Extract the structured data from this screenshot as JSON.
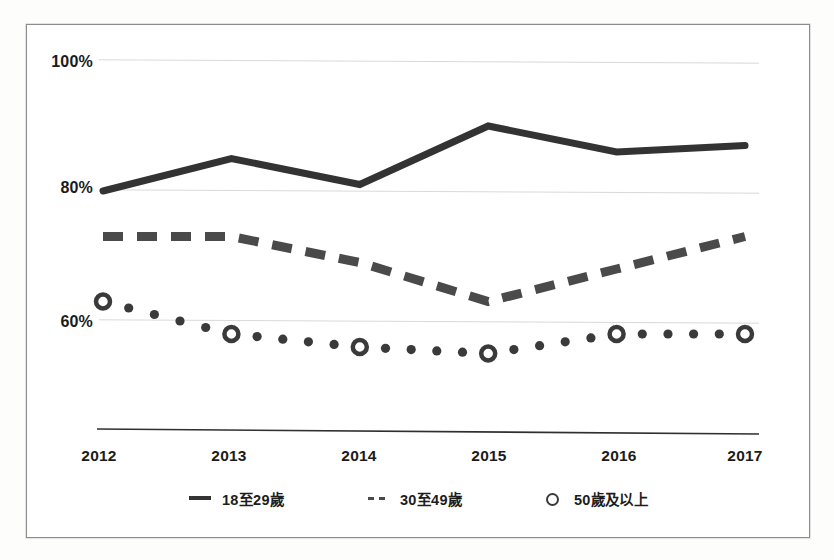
{
  "chart_data": {
    "type": "line",
    "title": "",
    "subtitle": "",
    "xlabel": "",
    "ylabel": "",
    "categories": [
      "2012",
      "2013",
      "2014",
      "2015",
      "2016",
      "2017"
    ],
    "x": [
      2012,
      2013,
      2014,
      2015,
      2016,
      2017
    ],
    "xlim": [
      2012,
      2017
    ],
    "ylim": [
      40,
      100
    ],
    "yticks": [
      60,
      80,
      100
    ],
    "ytick_labels": [
      "60%",
      "80%",
      "100%"
    ],
    "grid": true,
    "grid_axis": "y",
    "legend_position": "bottom",
    "value_unit": "%",
    "series": [
      {
        "name": "18至29歲",
        "style": "solid",
        "marker": "none",
        "color": "#333333",
        "values": [
          80,
          85,
          81,
          90,
          86,
          87
        ]
      },
      {
        "name": "30至49歲",
        "style": "dashed",
        "marker": "none",
        "color": "#4a4a4a",
        "values": [
          73,
          73,
          69,
          63,
          68,
          73
        ]
      },
      {
        "name": "50歲及以上",
        "style": "dotted",
        "marker": "circle",
        "color": "#3a3a3a",
        "values": [
          63,
          58,
          56,
          55,
          58,
          58
        ]
      }
    ]
  },
  "axes": {
    "y_tick_labels": [
      "100%",
      "80%",
      "60%"
    ],
    "x_tick_labels": [
      "2012",
      "2013",
      "2014",
      "2015",
      "2016",
      "2017"
    ]
  },
  "legend": {
    "items": [
      {
        "label": "18至29歲",
        "marker": "solid-line-swatch"
      },
      {
        "label": "30至49歲",
        "marker": "dashed-line-swatch"
      },
      {
        "label": "50歲及以上",
        "marker": "circle-marker-swatch"
      }
    ]
  }
}
